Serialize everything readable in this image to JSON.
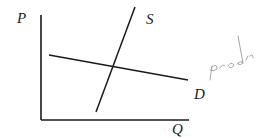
{
  "diagram": {
    "type": "supply-demand",
    "axes": {
      "y_label": "P",
      "x_label": "Q"
    },
    "curves": [
      {
        "name": "supply",
        "label": "S"
      },
      {
        "name": "demand",
        "label": "D"
      }
    ],
    "annotation": {
      "handwritten_text": "prob",
      "color": "#9a9a9a"
    },
    "colors": {
      "line": "#1a1a1a",
      "background": "#ffffff"
    }
  }
}
